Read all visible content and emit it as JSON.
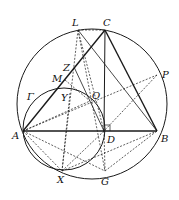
{
  "diagram": {
    "type": "geometry",
    "labels": {
      "L": "L",
      "C": "C",
      "Z": "Z",
      "M": "M",
      "P": "P",
      "Gamma": "Γ",
      "Y": "Y",
      "O": "O",
      "A": "A",
      "D": "D",
      "B": "B",
      "X": "X",
      "G": "G"
    },
    "points": {
      "A": [
        23,
        131
      ],
      "B": [
        157,
        131
      ],
      "C": [
        105,
        30
      ],
      "D": [
        104,
        131
      ],
      "G": [
        105,
        171
      ],
      "X": [
        62,
        171
      ],
      "L": [
        78,
        30
      ],
      "P": [
        157,
        75
      ],
      "O": [
        90,
        101
      ],
      "Z": [
        74,
        67
      ],
      "M": [
        65,
        80
      ],
      "Y": [
        70,
        93
      ]
    },
    "circles": [
      {
        "name": "circumcircle",
        "cx": 92,
        "cy": 104,
        "r": 75
      },
      {
        "name": "Gamma",
        "cx": 64,
        "cy": 129,
        "r": 41
      }
    ],
    "colors": {
      "stroke": "#1a1a1a",
      "background": "#ffffff"
    }
  }
}
